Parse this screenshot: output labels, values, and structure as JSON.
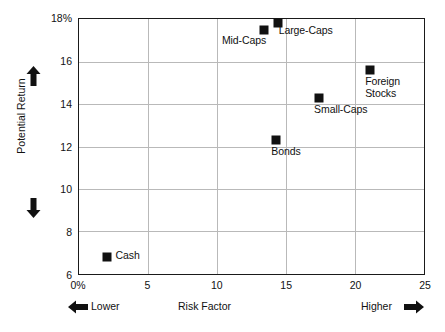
{
  "chart_data": {
    "type": "scatter",
    "title": "",
    "xlabel": "Risk Factor",
    "ylabel": "Potential Return",
    "xlim": [
      0,
      25
    ],
    "ylim": [
      6,
      18
    ],
    "grid": true,
    "legend": "none",
    "x_tick_labels": [
      "0%",
      "5",
      "10",
      "15",
      "20",
      "25"
    ],
    "x_tick_values": [
      0,
      5,
      10,
      15,
      20,
      25
    ],
    "y_tick_labels": [
      "6",
      "8",
      "10",
      "12",
      "14",
      "16",
      "18%"
    ],
    "y_tick_values": [
      6,
      8,
      10,
      12,
      14,
      16,
      18
    ],
    "marker_color": "#111111",
    "grid_color": "#b9b9b9",
    "frame_color": "#1a1a1a",
    "points": [
      {
        "label": "Cash",
        "x": 2.0,
        "y": 6.8,
        "label_pos": "right"
      },
      {
        "label": "Bonds",
        "x": 14.3,
        "y": 12.3,
        "label_pos": "below"
      },
      {
        "label": "Small-Caps",
        "x": 17.4,
        "y": 14.3,
        "label_pos": "below"
      },
      {
        "label": "Foreign\nStocks",
        "x": 21.1,
        "y": 15.6,
        "label_pos": "below"
      },
      {
        "label": "Mid-Caps",
        "x": 13.4,
        "y": 17.5,
        "label_pos": "below-left"
      },
      {
        "label": "Large-Caps",
        "x": 14.4,
        "y": 17.8,
        "label_pos": "below-right"
      }
    ],
    "annotations": {
      "x_low": "Lower",
      "x_high": "Higher",
      "y_up_arrow": "up-arrow",
      "y_down_arrow": "down-arrow",
      "x_left_arrow": "left-arrow",
      "x_right_arrow": "right-arrow"
    }
  }
}
